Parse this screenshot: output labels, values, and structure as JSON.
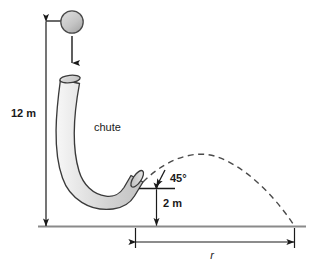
{
  "diagram": {
    "labels": {
      "height_total": "12 m",
      "exit_height": "2 m",
      "launch_angle": "45°",
      "chute": "chute",
      "range": "r"
    },
    "colors": {
      "line": "#1a1a1a",
      "ground": "#808080",
      "chute_fill_light": "#f2f2f2",
      "chute_fill_mid": "#d9d9d9",
      "chute_fill_dark": "#bdbdbd",
      "chute_stroke": "#3a3a3a",
      "ball_fill": "#c4c4c4",
      "ball_stroke": "#4a4a4a",
      "dashed": "#4a4a4a",
      "text": "#1a1a1a"
    },
    "geometry": {
      "ground_y": 226,
      "ground_x_start": 38,
      "ground_x_end": 306,
      "ball_center_x": 72,
      "ball_center_y": 22,
      "ball_radius": 11,
      "chute_top_x": 70,
      "chute_top_y": 76,
      "chute_exit_x": 135,
      "chute_exit_y": 187,
      "dim_line_x": 46,
      "trajectory_peak_x": 216,
      "trajectory_peak_y": 156,
      "trajectory_land_x": 295,
      "range_dim_y": 243,
      "range_start_x": 135,
      "range_end_x": 295
    }
  }
}
